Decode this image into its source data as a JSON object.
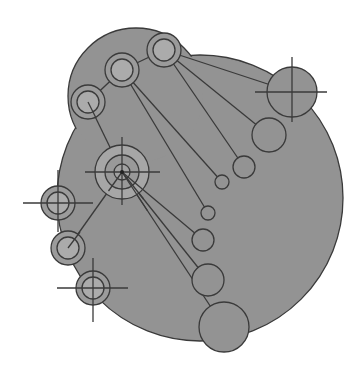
{
  "diagram": {
    "colors": {
      "background": "#ffffff",
      "blob_fill": "#939393",
      "stroke": "#3a3a3a",
      "ring_band": "#9b9b9b",
      "ring_inner": "#ababab",
      "hub_fill": "#a6a6a6"
    },
    "blob": {
      "main": {
        "cx": 200,
        "cy": 198,
        "r": 143
      },
      "lobe": {
        "cx": 136,
        "cy": 96,
        "r": 68
      }
    },
    "hub": {
      "cx": 122,
      "cy": 172,
      "rings": [
        27,
        17,
        8
      ],
      "cross": {
        "x1": 85,
        "x2": 160,
        "y1": 137,
        "y2": 205
      }
    },
    "rings": [
      {
        "id": "ring-top-right",
        "cx": 164,
        "cy": 50,
        "r_outer": 17,
        "r_inner": 11
      },
      {
        "id": "ring-top-middle",
        "cx": 122,
        "cy": 70,
        "r_outer": 17,
        "r_inner": 11
      },
      {
        "id": "ring-top-left",
        "cx": 88,
        "cy": 102,
        "r_outer": 17,
        "r_inner": 11
      },
      {
        "id": "ring-left-upper",
        "cx": 58,
        "cy": 203,
        "r_outer": 17,
        "r_inner": 11,
        "cross": {
          "x1": 23,
          "x2": 93,
          "y1": 170,
          "y2": 232
        }
      },
      {
        "id": "ring-left-middle",
        "cx": 68,
        "cy": 248,
        "r_outer": 17,
        "r_inner": 11
      },
      {
        "id": "ring-left-lower",
        "cx": 93,
        "cy": 288,
        "r_outer": 17,
        "r_inner": 11,
        "cross": {
          "x1": 57,
          "x2": 128,
          "y1": 258,
          "y2": 322
        }
      }
    ],
    "satellites": [
      {
        "id": "sat-crosshair-right",
        "cx": 292,
        "cy": 92,
        "r": 25,
        "cross": {
          "x1": 255,
          "x2": 327,
          "y1": 57,
          "y2": 122
        }
      },
      {
        "id": "sat-right-2",
        "cx": 269,
        "cy": 135,
        "r": 17
      },
      {
        "id": "sat-right-3",
        "cx": 244,
        "cy": 167,
        "r": 11
      },
      {
        "id": "sat-small-1",
        "cx": 222,
        "cy": 182,
        "r": 7
      },
      {
        "id": "sat-small-2",
        "cx": 208,
        "cy": 213,
        "r": 7
      },
      {
        "id": "sat-mid-1",
        "cx": 203,
        "cy": 240,
        "r": 11
      },
      {
        "id": "sat-mid-2",
        "cx": 208,
        "cy": 280,
        "r": 16
      },
      {
        "id": "sat-bottom",
        "cx": 224,
        "cy": 327,
        "r": 25
      }
    ],
    "links": [
      {
        "x1": 164,
        "y1": 50,
        "x2": 292,
        "y2": 92
      },
      {
        "x1": 164,
        "y1": 50,
        "x2": 269,
        "y2": 135
      },
      {
        "x1": 164,
        "y1": 50,
        "x2": 244,
        "y2": 167
      },
      {
        "x1": 122,
        "y1": 70,
        "x2": 222,
        "y2": 182
      },
      {
        "x1": 122,
        "y1": 70,
        "x2": 208,
        "y2": 213
      },
      {
        "x1": 88,
        "y1": 102,
        "x2": 122,
        "y2": 70
      },
      {
        "x1": 122,
        "y1": 70,
        "x2": 164,
        "y2": 50
      },
      {
        "x1": 88,
        "y1": 102,
        "x2": 122,
        "y2": 172
      },
      {
        "x1": 122,
        "y1": 172,
        "x2": 68,
        "y2": 248
      },
      {
        "x1": 122,
        "y1": 172,
        "x2": 203,
        "y2": 240
      },
      {
        "x1": 122,
        "y1": 172,
        "x2": 208,
        "y2": 280
      },
      {
        "x1": 122,
        "y1": 172,
        "x2": 224,
        "y2": 327
      }
    ]
  }
}
